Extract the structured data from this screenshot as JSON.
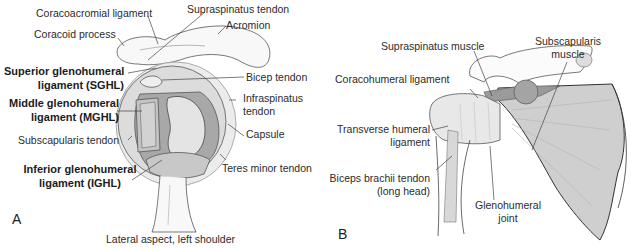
{
  "figure": {
    "panel_a": {
      "letter": "A",
      "caption": "Lateral aspect, left shoulder",
      "labels": {
        "coracoacromial_ligament": "Coracoacromial ligament",
        "supraspinatus_tendon": "Supraspinatus tendon",
        "acromion": "Acromion",
        "coracoid_process": "Coracoid process",
        "sghl_line1": "Superior glenohumeral",
        "sghl_line2": "ligament (SGHL)",
        "bicep_tendon": "Bicep tendon",
        "mghl_line1": "Middle glenohumeral",
        "mghl_line2": "ligament (MGHL)",
        "infraspinatus_line1": "Infraspinatus",
        "infraspinatus_line2": "tendon",
        "capsule": "Capsule",
        "subscapularis_tendon": "Subscapularis tendon",
        "ighl_line1": "Inferior glenohumeral",
        "ighl_line2": "ligament (IGHL)",
        "teres_minor_tendon": "Teres minor tendon"
      }
    },
    "panel_b": {
      "letter": "B",
      "labels": {
        "supraspinatus_muscle": "Supraspinatus muscle",
        "subscapularis_line1": "Subscapularis",
        "subscapularis_line2": "muscle",
        "coracohumeral_ligament": "Coracohumeral ligament",
        "transverse_line1": "Transverse humeral",
        "transverse_line2": "ligament",
        "biceps_line1": "Biceps brachii tendon",
        "biceps_line2": "(long head)",
        "glenohumeral_line1": "Glenohumeral",
        "glenohumeral_line2": "joint"
      }
    },
    "colors": {
      "outline": "#3a3a3a",
      "light_fill": "#e6e6e6",
      "mid_fill": "#c9c9c9",
      "dark_fill": "#9d9d9d",
      "bone": "#f7f7f7"
    }
  }
}
